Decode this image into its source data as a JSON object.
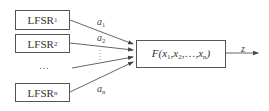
{
  "diagram": {
    "title": "",
    "registers": [
      {
        "label": "LFSR",
        "subscript": "1",
        "output_label": "a",
        "output_subscript": "1"
      },
      {
        "label": "LFSR",
        "subscript": "2",
        "output_label": "a",
        "output_subscript": "2"
      },
      {
        "label": "LFSR",
        "subscript": "n",
        "output_label": "a",
        "output_subscript": "n"
      }
    ],
    "ellipsis_horizontal": "…",
    "ellipsis_vertical": "⋮",
    "combiner": {
      "function_name": "F",
      "args": [
        {
          "name": "x",
          "sub": "1"
        },
        {
          "name": "x",
          "sub": "2"
        },
        {
          "name": "…",
          "sub": ""
        },
        {
          "name": "x",
          "sub": "n"
        }
      ]
    },
    "output": {
      "label": "z"
    },
    "colors": {
      "line": "#555555",
      "text": "#333333",
      "background": "#ffffff"
    }
  }
}
